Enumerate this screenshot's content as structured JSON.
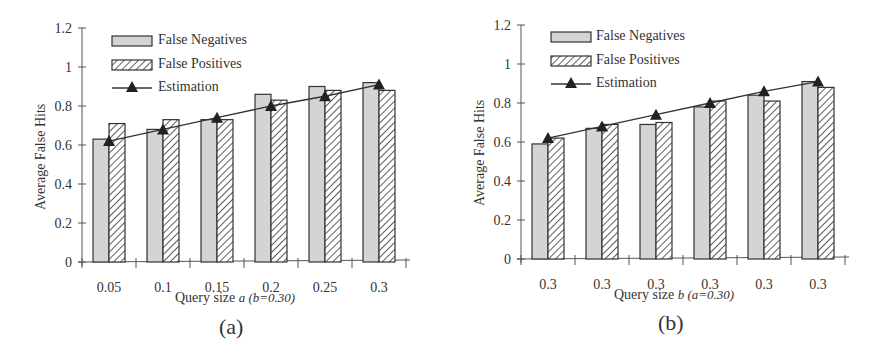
{
  "chart_data": [
    {
      "type": "bar",
      "panel": "(a)",
      "xlabel": "Query size a (b=0.30)",
      "xlabel_main": "Query size",
      "xlabel_var": "a (b=0.30)",
      "ylabel": "Average False Hits",
      "ylim": [
        0,
        1.2
      ],
      "yticks": [
        "0",
        "0.2",
        "0.4",
        "0.6",
        "0.8",
        "1",
        "1.2"
      ],
      "categories": [
        "0.05",
        "0.1",
        "0.15",
        "0.2",
        "0.25",
        "0.3"
      ],
      "legend": [
        "False Negatives",
        "False Positives",
        "Estimation"
      ],
      "series": [
        {
          "name": "False Negatives",
          "kind": "bar",
          "values": [
            0.63,
            0.68,
            0.73,
            0.86,
            0.9,
            0.92
          ]
        },
        {
          "name": "False Positives",
          "kind": "bar",
          "values": [
            0.71,
            0.73,
            0.73,
            0.83,
            0.88,
            0.88
          ]
        },
        {
          "name": "Estimation",
          "kind": "line",
          "values": [
            0.62,
            0.68,
            0.74,
            0.8,
            0.85,
            0.91
          ]
        }
      ],
      "grid": false,
      "legend_position": "top-left inside"
    },
    {
      "type": "bar",
      "panel": "(b)",
      "xlabel": "Query size b (a=0.30)",
      "xlabel_main": "Query size",
      "xlabel_var": "b (a=0.30)",
      "ylabel": "Average False Hits",
      "ylim": [
        0,
        1.2
      ],
      "yticks": [
        "0",
        "0.2",
        "0.4",
        "0.6",
        "0.8",
        "1",
        "1.2"
      ],
      "categories": [
        "0.3",
        "0.3",
        "0.3",
        "0.3",
        "0.3",
        "0.3"
      ],
      "legend": [
        "False Negatives",
        "False Positives",
        "Estimation"
      ],
      "series": [
        {
          "name": "False Negatives",
          "kind": "bar",
          "values": [
            0.59,
            0.67,
            0.69,
            0.78,
            0.84,
            0.91
          ]
        },
        {
          "name": "False Positives",
          "kind": "bar",
          "values": [
            0.62,
            0.69,
            0.7,
            0.81,
            0.81,
            0.88
          ]
        },
        {
          "name": "Estimation",
          "kind": "line",
          "values": [
            0.62,
            0.68,
            0.74,
            0.8,
            0.86,
            0.91
          ]
        }
      ],
      "grid": false,
      "legend_position": "top-left inside"
    }
  ],
  "colors": {
    "fn_fill": "#d4d4d4",
    "fp_fill": "#ffffff",
    "hatch": "#333333",
    "line": "#333333",
    "axis": "#555555"
  }
}
